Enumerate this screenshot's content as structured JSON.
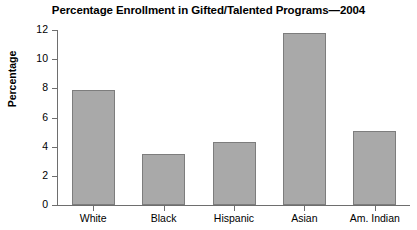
{
  "chart_data": {
    "type": "bar",
    "title": "Percentage Enrollment in Gifted/Talented Programs—2004",
    "xlabel": "",
    "ylabel": "Percentage",
    "categories": [
      "White",
      "Black",
      "Hispanic",
      "Asian",
      "Am. Indian"
    ],
    "values": [
      7.9,
      3.5,
      4.3,
      11.8,
      5.1
    ],
    "ylim": [
      0,
      12
    ],
    "yticks": [
      0,
      2,
      4,
      6,
      8,
      10,
      12
    ],
    "ytick_labels": [
      "0",
      "2",
      "4",
      "6",
      "8",
      "10",
      "12"
    ],
    "grid": false,
    "legend": false,
    "bar_color": "#a9a9a9",
    "bar_edge_color": "#7d7d7d",
    "axis_color": "#6e6e6e"
  }
}
